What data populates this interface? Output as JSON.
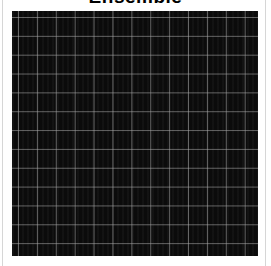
{
  "title": "Ensemble",
  "image": {
    "description": "dark square image with light gray grid lines",
    "grid_rows": 13,
    "grid_cols": 13,
    "background_color": "#0b0b0b",
    "line_color": "#aaaaaa"
  }
}
